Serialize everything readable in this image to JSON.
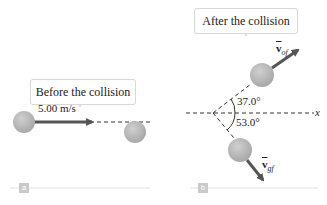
{
  "panels": [
    {
      "id": "a",
      "tag": "a",
      "callout": "Before the collision",
      "velocity_label": "5.00 m/s"
    },
    {
      "id": "b",
      "tag": "b",
      "callout": "After the collision",
      "vectors": [
        {
          "symbol": "v",
          "subscript": "of"
        },
        {
          "symbol": "v",
          "subscript": "gf"
        }
      ],
      "angles": [
        "37.0°",
        "53.0°"
      ],
      "axis_label": "x"
    }
  ],
  "colors": {
    "ball": "#b8b8b8",
    "arrow": "#555555",
    "dashed": "#333333",
    "panel_line": "#dddddd",
    "tag": "#c9c9c9"
  }
}
